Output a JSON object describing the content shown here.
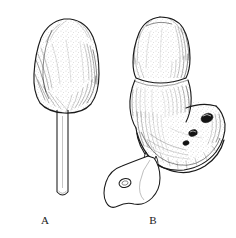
{
  "figure": {
    "kind": "scientific-line-drawing",
    "medium": "pen-and-ink stipple and hatch",
    "background_color": "#ffffff",
    "ink_color": "#1a1a1a",
    "panel_count": 2,
    "width_px": 236,
    "height_px": 238,
    "panels": [
      {
        "id": "A",
        "label": "A",
        "label_x": 45,
        "label_y": 220,
        "description": "Club-shaped bulbous head mounted on a long slender straight stalk",
        "parts": [
          {
            "name": "cap",
            "shape": "rounded-trapezoidal club",
            "bbox": [
              30,
              18,
              98,
              112
            ],
            "shading": "stipple interior with dense hatching along lower-left and lower-right margins"
          },
          {
            "name": "stalk",
            "shape": "narrow parallel-sided tube",
            "bbox": [
              56,
              108,
              70,
              196
            ],
            "shading": "two parallel outline strokes with open rounded tip at base"
          },
          {
            "name": "stalk-tip",
            "shape": "open ellipse",
            "bbox": [
              56,
              190,
              70,
              197
            ]
          }
        ]
      },
      {
        "id": "B",
        "label": "B",
        "label_x": 153,
        "label_y": 220,
        "description": "Multi-lobed bulbous structure: upper rounded lobe, median constricted band, lower swollen bulb with dark pore openings, and a flat ventral foot with a small ring aperture",
        "parts": [
          {
            "name": "upper-lobe",
            "shape": "dome-tipped ovoid",
            "bbox": [
              131,
              16,
              190,
              76
            ],
            "shading": "stipple with hatch on right flank"
          },
          {
            "name": "constriction-band",
            "shape": "transverse annulus",
            "bbox": [
              131,
              70,
              190,
              82
            ]
          },
          {
            "name": "mid-lobe",
            "shape": "broad rounded segment",
            "bbox": [
              128,
              78,
              190,
              122
            ],
            "shading": "stipple with vertical hatch streaks"
          },
          {
            "name": "lower-bulb",
            "shape": "laterally expanded sac curving to the right",
            "bbox": [
              132,
              100,
              226,
              168
            ],
            "shading": "dense curved hatching along rim"
          },
          {
            "name": "pore-openings",
            "count": 3,
            "shape": "dark filled ellipses",
            "positions": [
              [
                206,
                118
              ],
              [
                192,
                133
              ],
              [
                186,
                142
              ]
            ]
          },
          {
            "name": "rim-fold",
            "shape": "thick curved marginal fold along lower edge of bulb",
            "bbox": [
              136,
              128,
              222,
              172
            ]
          },
          {
            "name": "foot-appendage",
            "shape": "flattened irregular lobate plate extending lower-left",
            "bbox": [
              104,
              150,
              170,
              208
            ]
          },
          {
            "name": "foot-ring",
            "shape": "small open ellipse aperture",
            "bbox": [
              119,
              178,
              131,
              188
            ]
          },
          {
            "name": "neck-junction",
            "shape": "small paired rounded knobs where foot meets bulb",
            "bbox": [
              143,
              150,
              160,
              165
            ]
          }
        ]
      }
    ]
  }
}
